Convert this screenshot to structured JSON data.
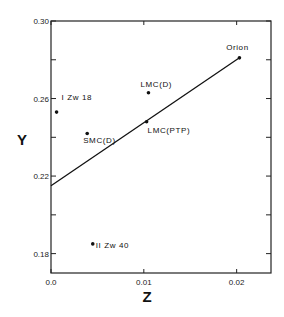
{
  "chart_data": {
    "type": "scatter",
    "title": "",
    "xlabel": "Z",
    "ylabel": "Y",
    "xlim": [
      0.0,
      0.0237
    ],
    "ylim": [
      0.17,
      0.3
    ],
    "grid": false,
    "legend": null,
    "x_ticks": [
      {
        "value": 0.0,
        "label": "0.0"
      },
      {
        "value": 0.01,
        "label": "0.01"
      },
      {
        "value": 0.02,
        "label": "0.02"
      }
    ],
    "y_ticks": [
      {
        "value": 0.18,
        "label": "0.18"
      },
      {
        "value": 0.2,
        "label": ""
      },
      {
        "value": 0.22,
        "label": "0.22"
      },
      {
        "value": 0.24,
        "label": ""
      },
      {
        "value": 0.26,
        "label": "0.26"
      },
      {
        "value": 0.28,
        "label": ""
      },
      {
        "value": 0.3,
        "label": "0.30"
      }
    ],
    "points": [
      {
        "label": "I Zw 18",
        "x": 0.0006,
        "y": 0.253,
        "label_dx": 5,
        "label_dy": -12,
        "anchor": "start"
      },
      {
        "label": "SMC(D)",
        "x": 0.0039,
        "y": 0.242,
        "label_dx": -4,
        "label_dy": 10,
        "anchor": "start"
      },
      {
        "label": "LMC(D)",
        "x": 0.0105,
        "y": 0.263,
        "label_dx": -8,
        "label_dy": -6,
        "anchor": "start"
      },
      {
        "label": "LMC(PTP)",
        "x": 0.0103,
        "y": 0.248,
        "label_dx": 1,
        "label_dy": 11,
        "anchor": "start"
      },
      {
        "label": "II Zw 40",
        "x": 0.0045,
        "y": 0.185,
        "label_dx": 3,
        "label_dy": 4,
        "anchor": "start"
      },
      {
        "label": "Orion",
        "x": 0.0203,
        "y": 0.281,
        "label_dx": -2,
        "label_dy": -8,
        "anchor": "middle"
      }
    ],
    "fit_line": {
      "x": [
        0.0,
        0.0203
      ],
      "y": [
        0.215,
        0.281
      ],
      "intercept": 0.215,
      "slope": 3.25
    }
  }
}
